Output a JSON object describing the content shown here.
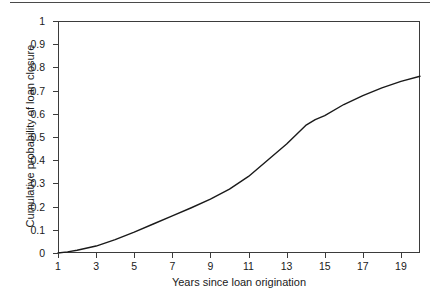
{
  "chart_data": {
    "type": "line",
    "title": "",
    "xlabel": "Years since loan origination",
    "ylabel": "Cumulative probability of loan closure",
    "xlim": [
      1,
      20
    ],
    "ylim": [
      0,
      1
    ],
    "grid": false,
    "legend": "none",
    "xticks": [
      "1",
      "3",
      "5",
      "7",
      "9",
      "11",
      "13",
      "15",
      "17",
      "19"
    ],
    "xtick_values": [
      1,
      3,
      5,
      7,
      9,
      11,
      13,
      15,
      17,
      19
    ],
    "yticks": [
      "0",
      "0.1",
      "0.2",
      "0.3",
      "0.4",
      "0.5",
      "0.6",
      "0.7",
      "0.8",
      "0.9",
      "1"
    ],
    "ytick_values": [
      0,
      0.1,
      0.2,
      0.3,
      0.4,
      0.5,
      0.6,
      0.7,
      0.8,
      0.9,
      1
    ],
    "series": [
      {
        "name": "Cumulative probability of loan closure",
        "color": "#1a1a1a",
        "x": [
          1,
          1.5,
          2,
          3,
          4,
          5,
          6,
          7,
          8,
          9,
          10,
          11,
          12,
          13,
          13.5,
          14,
          14.5,
          15,
          16,
          17,
          18,
          19,
          20
        ],
        "values": [
          0.0,
          0.005,
          0.012,
          0.03,
          0.058,
          0.09,
          0.125,
          0.16,
          0.195,
          0.232,
          0.275,
          0.33,
          0.4,
          0.47,
          0.51,
          0.55,
          0.575,
          0.592,
          0.64,
          0.678,
          0.712,
          0.74,
          0.762
        ]
      }
    ]
  },
  "figure": {
    "top_rule_color": "#4a4a4a",
    "axis_color": "#3b3b3b",
    "background": "#ffffff"
  }
}
